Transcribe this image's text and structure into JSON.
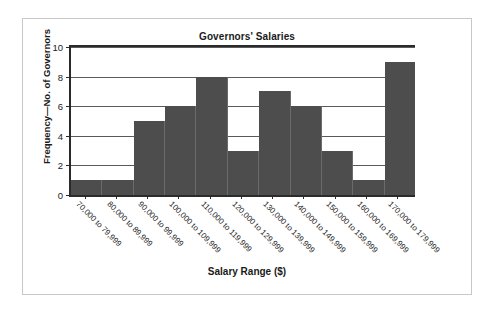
{
  "chart_data": {
    "type": "bar",
    "title": "Governors' Salaries",
    "xlabel": "Salary Range ($)",
    "ylabel": "Frequency—No. of Governors",
    "categories": [
      "70,000 to 79,999",
      "80,000 to 89,999",
      "90,000 to 99,999",
      "100,000 to 109,999",
      "110,000 to 119,999",
      "120,000 to 129,999",
      "130,000 to 139,999",
      "140,000 to 149,999",
      "150,000 to 159,999",
      "160,000 to 169,999",
      "170,000 to 179,999"
    ],
    "values": [
      1,
      1,
      5,
      6,
      8,
      3,
      7,
      6,
      3,
      1,
      9
    ],
    "ylim": [
      0,
      10
    ],
    "y_ticks": [
      0,
      2,
      4,
      6,
      8,
      10
    ],
    "y_tick_labels": [
      "0",
      "2",
      "4",
      "6",
      "8",
      "10"
    ],
    "grid": true,
    "legend": false,
    "bar_color": "#4d4d4d",
    "axis_color": "#2b2b2b",
    "gridline_color": "#5a5a5a",
    "frame_color": "#c8c8c8",
    "background": "#ffffff"
  }
}
